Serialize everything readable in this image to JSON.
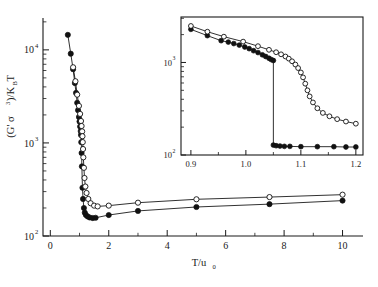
{
  "figure": {
    "name": "shear-modulus-vs-temperature-plot",
    "background_color": "#ffffff",
    "line_color": "#1a1a1a"
  },
  "main_axes": {
    "xlabel": "T/u",
    "xlabel_sub": "0",
    "ylabel_prefix": "(G' σ",
    "ylabel_sup": "3",
    "ylabel_suffix": ")/K",
    "ylabel_suffix_sub": "B",
    "ylabel_tail": "T",
    "x_ticks": [
      "0",
      "2",
      "4",
      "6",
      "8",
      "10"
    ],
    "y_ticks": [
      "10",
      "10",
      "10"
    ],
    "y_tick_exponents": [
      "2",
      "3",
      "4"
    ],
    "xlim": [
      -0.25,
      10.7
    ],
    "ylim": [
      100,
      22000
    ],
    "yscale": "log",
    "xscale": "linear"
  },
  "inset_axes": {
    "x_ticks": [
      "0.9",
      "1.0",
      "1.1",
      "1.2"
    ],
    "y_ticks": [
      "10",
      "10"
    ],
    "y_tick_exponents": [
      "2",
      "3"
    ],
    "xlim": [
      0.882,
      1.213
    ],
    "ylim": [
      100,
      3100
    ],
    "yscale": "log",
    "xscale": "linear"
  },
  "chart_data": {
    "type": "line",
    "title": "",
    "xlabel": "T/u0",
    "ylabel": "(G' sigma^3)/KB T",
    "xscale": "linear",
    "yscale": "log",
    "xlim": [
      -0.25,
      10.7
    ],
    "ylim": [
      100,
      22000
    ],
    "grid": false,
    "legend": "none",
    "series": [
      {
        "name": "heating-branch-filled-circles",
        "marker": "filled-circle",
        "x": [
          0.6,
          0.7,
          0.78,
          0.84,
          0.88,
          0.92,
          0.95,
          0.98,
          1.0,
          1.02,
          1.04,
          1.05,
          1.06,
          1.07,
          1.08,
          1.1,
          1.12,
          1.15,
          1.18,
          1.22,
          1.28,
          1.35,
          1.45,
          1.55,
          2.0,
          3.0,
          5.0,
          7.5,
          10.0
        ],
        "y": [
          14500,
          9100,
          6200,
          4400,
          3450,
          2700,
          2250,
          1900,
          1700,
          1500,
          1340,
          1220,
          1020,
          780,
          560,
          330,
          250,
          200,
          178,
          168,
          162,
          158,
          156,
          157,
          168,
          186,
          205,
          220,
          240
        ]
      },
      {
        "name": "cooling-branch-open-circles",
        "marker": "open-circle",
        "x": [
          0.78,
          0.86,
          0.92,
          0.98,
          1.02,
          1.05,
          1.07,
          1.09,
          1.1,
          1.11,
          1.12,
          1.13,
          1.15,
          1.17,
          1.2,
          1.24,
          1.3,
          1.38,
          1.5,
          1.62,
          2.0,
          3.0,
          5.0,
          7.5,
          10.0
        ],
        "y": [
          6500,
          4600,
          3300,
          2500,
          2050,
          1720,
          1520,
          1330,
          1180,
          1020,
          860,
          700,
          540,
          420,
          340,
          290,
          250,
          225,
          212,
          208,
          212,
          228,
          248,
          262,
          278
        ]
      }
    ]
  },
  "inset_data": {
    "type": "line",
    "xlabel": "T/u0",
    "ylabel": "(G' sigma^3)/KB T",
    "xscale": "linear",
    "yscale": "log",
    "xlim": [
      0.882,
      1.213
    ],
    "ylim": [
      100,
      3100
    ],
    "grid": false,
    "legend": "none",
    "series": [
      {
        "name": "heating-branch-filled-circles",
        "marker": "filled-circle",
        "x": [
          0.9,
          0.93,
          0.955,
          0.968,
          0.978,
          0.988,
          0.998,
          1.006,
          1.014,
          1.022,
          1.03,
          1.036,
          1.042,
          1.046,
          1.05,
          1.05,
          1.055,
          1.062,
          1.07,
          1.08,
          1.1,
          1.13,
          1.16,
          1.182,
          1.2
        ],
        "y": [
          2280,
          1950,
          1720,
          1660,
          1600,
          1540,
          1470,
          1410,
          1340,
          1280,
          1210,
          1160,
          1110,
          1075,
          1050,
          128,
          126,
          125,
          124,
          124,
          123,
          123,
          123,
          122,
          122
        ]
      },
      {
        "name": "cooling-branch-open-circles",
        "marker": "open-circle",
        "x": [
          0.9,
          0.93,
          0.96,
          0.995,
          1.022,
          1.042,
          1.055,
          1.064,
          1.072,
          1.078,
          1.084,
          1.09,
          1.095,
          1.1,
          1.104,
          1.108,
          1.112,
          1.116,
          1.122,
          1.13,
          1.14,
          1.152,
          1.166,
          1.182,
          1.2
        ],
        "y": [
          2480,
          2150,
          1900,
          1680,
          1500,
          1370,
          1290,
          1225,
          1160,
          1100,
          1030,
          950,
          870,
          780,
          690,
          590,
          500,
          430,
          370,
          320,
          285,
          262,
          244,
          230,
          218
        ]
      }
    ]
  }
}
